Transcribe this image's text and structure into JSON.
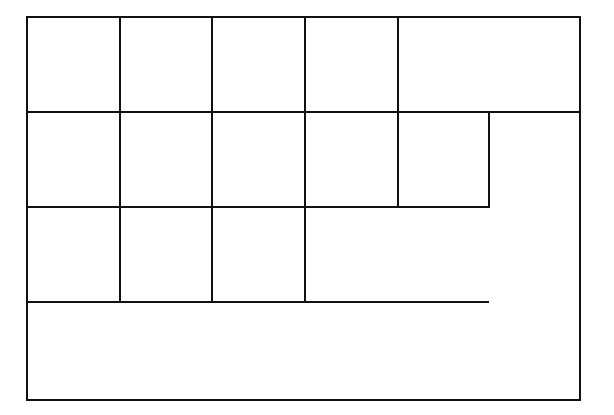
{
  "diagram": {
    "type": "grid-of-rectangles",
    "stroke_color": "#111111",
    "background": "#ffffff",
    "outer_frame": {
      "x1": 27,
      "y1": 17,
      "x2": 580,
      "y2": 400
    },
    "rows_y": [
      17,
      112,
      207,
      302,
      400
    ],
    "cols_x": [
      27,
      120,
      212,
      305,
      398,
      489,
      580
    ],
    "cells": [
      {
        "row": 1,
        "x1": 27,
        "y1": 17,
        "x2": 120,
        "y2": 112
      },
      {
        "row": 1,
        "x1": 120,
        "y1": 17,
        "x2": 212,
        "y2": 112
      },
      {
        "row": 1,
        "x1": 212,
        "y1": 17,
        "x2": 305,
        "y2": 112
      },
      {
        "row": 1,
        "x1": 305,
        "y1": 17,
        "x2": 398,
        "y2": 112
      },
      {
        "row": 1,
        "x1": 398,
        "y1": 17,
        "x2": 580,
        "y2": 112
      },
      {
        "row": 2,
        "x1": 27,
        "y1": 112,
        "x2": 120,
        "y2": 207
      },
      {
        "row": 2,
        "x1": 120,
        "y1": 112,
        "x2": 212,
        "y2": 207
      },
      {
        "row": 2,
        "x1": 212,
        "y1": 112,
        "x2": 305,
        "y2": 207
      },
      {
        "row": 2,
        "x1": 305,
        "y1": 112,
        "x2": 398,
        "y2": 207
      },
      {
        "row": 2,
        "x1": 398,
        "y1": 112,
        "x2": 489,
        "y2": 207
      },
      {
        "row": 3,
        "x1": 27,
        "y1": 207,
        "x2": 120,
        "y2": 302
      },
      {
        "row": 3,
        "x1": 120,
        "y1": 207,
        "x2": 212,
        "y2": 302
      },
      {
        "row": 3,
        "x1": 212,
        "y1": 207,
        "x2": 305,
        "y2": 302
      }
    ],
    "extra_lines": [
      {
        "name": "row3-bottom-extension",
        "x1": 305,
        "y1": 302,
        "x2": 489,
        "y2": 302
      },
      {
        "name": "row2-bottom-extension",
        "x1": 305,
        "y1": 207,
        "x2": 489,
        "y2": 207
      }
    ]
  }
}
